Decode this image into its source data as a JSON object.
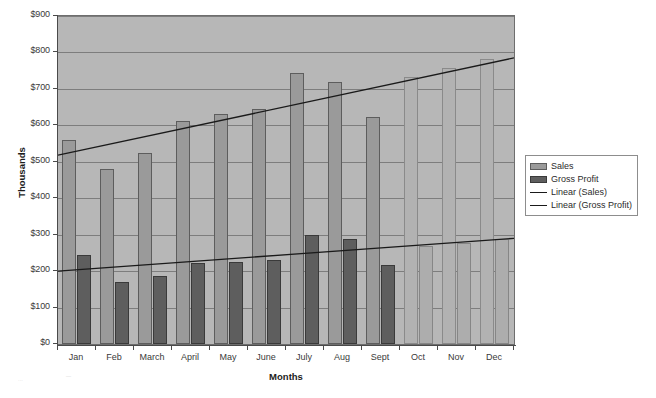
{
  "chart_data": {
    "type": "bar",
    "title": "",
    "xlabel": "Months",
    "ylabel": "Thousands",
    "ylim": [
      0,
      900
    ],
    "ytick_labels": [
      "$900",
      "$800",
      "$700",
      "$600",
      "$500",
      "$400",
      "$300",
      "$200",
      "$100",
      "$0"
    ],
    "ytick_values": [
      900,
      800,
      700,
      600,
      500,
      400,
      300,
      200,
      100,
      0
    ],
    "grid": true,
    "legend_position": "right-outside",
    "categories": [
      "Jan",
      "Feb",
      "March",
      "April",
      "May",
      "June",
      "July",
      "Aug",
      "Sept",
      "Oct",
      "Nov",
      "Dec"
    ],
    "series": [
      {
        "name": "Sales",
        "kind": "bar",
        "color": "#9a9a9a",
        "projected_color": "#b2b2b2",
        "values": [
          560,
          480,
          525,
          613,
          632,
          645,
          745,
          720,
          622,
          733,
          758,
          782
        ],
        "projected": [
          false,
          false,
          false,
          false,
          false,
          false,
          false,
          false,
          false,
          true,
          true,
          true
        ]
      },
      {
        "name": "Gross Profit",
        "kind": "bar",
        "color": "#5e5e5e",
        "projected_color": "#adadad",
        "values": [
          245,
          170,
          188,
          222,
          225,
          230,
          300,
          288,
          218,
          268,
          278,
          288
        ],
        "projected": [
          false,
          false,
          false,
          false,
          false,
          false,
          false,
          false,
          false,
          true,
          true,
          true
        ]
      },
      {
        "name": "Linear (Sales)",
        "kind": "trendline",
        "color": "#1a1a1a",
        "start_value": 518,
        "end_value": 785
      },
      {
        "name": "Linear (Gross Profit)",
        "kind": "trendline",
        "color": "#1a1a1a",
        "start_value": 200,
        "end_value": 290
      }
    ],
    "legend_entries": [
      {
        "label": "Sales",
        "marker": "swatch-sales"
      },
      {
        "label": "Gross Profit",
        "marker": "swatch-profit"
      },
      {
        "label": "Linear (Sales)",
        "marker": "line"
      },
      {
        "label": "Linear (Gross Profit)",
        "marker": "line"
      }
    ]
  },
  "axes": {
    "y_title": "Thousands",
    "x_title": "Months"
  }
}
